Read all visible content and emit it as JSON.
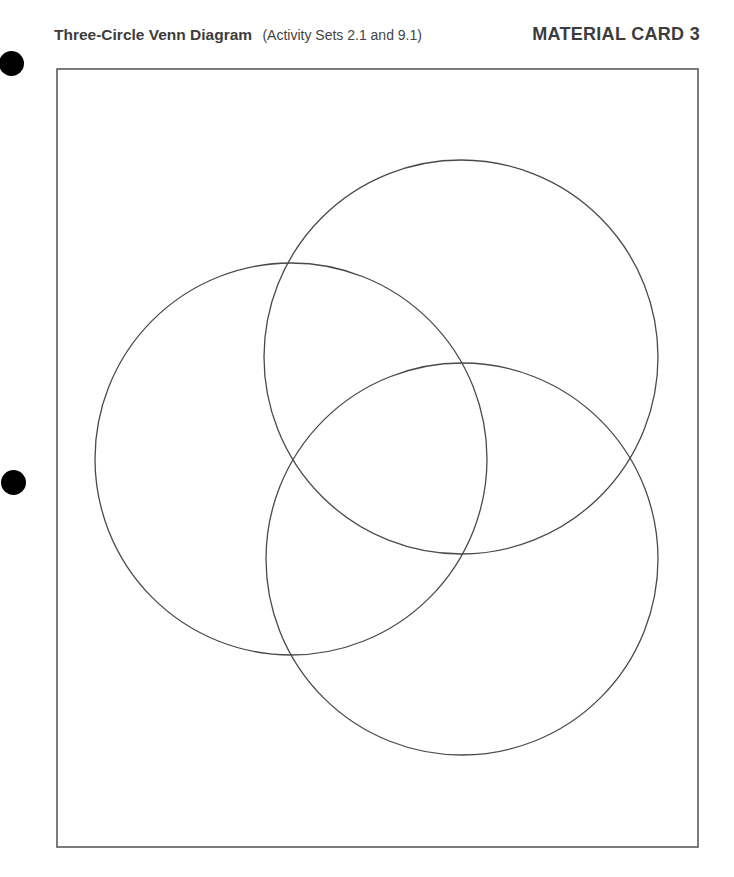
{
  "header": {
    "title": "Three-Circle Venn Diagram",
    "subtitle": "(Activity Sets 2.1 and 9.1)",
    "card_label": "MATERIAL CARD 3"
  },
  "diagram": {
    "type": "three-circle-venn",
    "frame": {
      "x": 57,
      "y": 69,
      "width": 641,
      "height": 778
    },
    "line_color": "#4a4a4a",
    "circles": [
      {
        "name": "top-right-circle",
        "cx": 461,
        "cy": 357,
        "r": 197
      },
      {
        "name": "left-circle",
        "cx": 291,
        "cy": 459,
        "r": 196
      },
      {
        "name": "bottom-circle",
        "cx": 462,
        "cy": 559,
        "r": 196
      }
    ]
  },
  "binder_holes": [
    {
      "name": "hole-top",
      "cx": 12,
      "cy": 63
    },
    {
      "name": "hole-middle",
      "cx": 14,
      "cy": 483
    }
  ]
}
